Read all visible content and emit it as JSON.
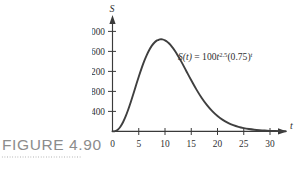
{
  "figure": {
    "caption": "FIGURE 4.90"
  },
  "chart_data": {
    "type": "line",
    "title": "",
    "subtitle": "",
    "xlabel": "t",
    "ylabel": "S",
    "annotation": "S(t) = 100t^2.5(0.75)^t",
    "annotation_parts": {
      "lhs": "S(t)",
      "equals": "=",
      "coefficient": "100",
      "base_var": "t",
      "exponent": "2.5",
      "decay_open": "(0.75)",
      "decay_exponent": "t"
    },
    "legend": [],
    "grid": false,
    "xlim": [
      0,
      33
    ],
    "ylim": [
      0,
      2200
    ],
    "xticks": [
      0,
      5,
      10,
      15,
      20,
      25,
      30
    ],
    "yticks": [
      400,
      800,
      1200,
      1600,
      2000
    ],
    "xtick_labels": [
      "0",
      "5",
      "10",
      "15",
      "20",
      "25",
      "30"
    ],
    "ytick_labels": [
      "400",
      "800",
      "1200",
      "1600",
      "2000"
    ],
    "series": [
      {
        "name": "S(t) = 100t^2.5(0.75)^t",
        "color": "#3f3f3f",
        "x": [
          0,
          0.5,
          1,
          1.5,
          2,
          2.5,
          3,
          3.5,
          4,
          4.5,
          5,
          5.5,
          6,
          6.5,
          7,
          7.5,
          8,
          8.5,
          8.69,
          9,
          9.5,
          10,
          10.5,
          11,
          12,
          13,
          14,
          15,
          16,
          17,
          18,
          19,
          20,
          21,
          22,
          23,
          24,
          25,
          26,
          27,
          28,
          29,
          30,
          31,
          32,
          33
        ],
        "y": [
          0,
          15,
          75,
          205,
          400,
          653,
          954,
          1291,
          1650,
          2017,
          2378,
          2720,
          3033,
          3309,
          3542,
          3728,
          3866,
          3956,
          3970,
          4000,
          4000,
          3959,
          3881,
          3770,
          3463,
          3076,
          2651,
          2223,
          1817,
          1452,
          1139,
          879,
          668,
          501,
          372,
          273,
          199,
          144,
          103,
          73,
          52,
          36,
          25,
          18,
          12,
          8
        ]
      }
    ],
    "peak": {
      "x": 8.7,
      "y": 1840,
      "label": ""
    },
    "note": "curve scaled to plotted maxima ~1840 at t~8.7"
  }
}
